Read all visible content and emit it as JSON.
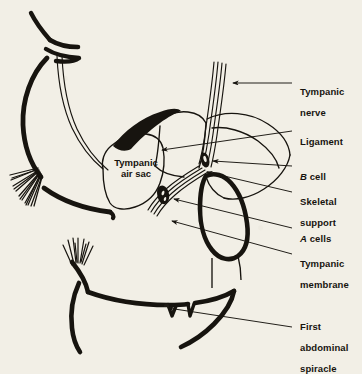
{
  "figure": {
    "background_color": "#f2efe6",
    "ink_color": "#17140f"
  },
  "inner_label": {
    "text": "Tympanic\nair sac",
    "name": "tympanic-air-sac"
  },
  "labels": [
    {
      "id": "tympanic-nerve",
      "line1": "Tympanic",
      "line2": "nerve",
      "italic_prefix": ""
    },
    {
      "id": "ligament",
      "line1": "Ligament",
      "line2": "",
      "italic_prefix": ""
    },
    {
      "id": "b-cell",
      "line1": "cell",
      "line2": "",
      "italic_prefix": "B"
    },
    {
      "id": "skeletal-support",
      "line1": "Skeletal",
      "line2": "support",
      "italic_prefix": ""
    },
    {
      "id": "a-cells",
      "line1": "cells",
      "line2": "",
      "italic_prefix": "A"
    },
    {
      "id": "tympanic-membrane",
      "line1": "Tympanic",
      "line2": "membrane",
      "italic_prefix": ""
    },
    {
      "id": "first-abdominal-spiracle",
      "line1": "First",
      "line2": "abdominal",
      "line3": "spiracle",
      "italic_prefix": ""
    }
  ],
  "structures": [
    {
      "id": "tympanic-nerve-bundle",
      "label": "tympanic nerve"
    },
    {
      "id": "ligament-wedge",
      "label": "ligament"
    },
    {
      "id": "b-cell-body",
      "label": "B cell"
    },
    {
      "id": "a-cells-cluster",
      "label": "A cells"
    },
    {
      "id": "tympanic-membrane-ring",
      "label": "tympanic membrane"
    },
    {
      "id": "skeletal-support-lobe",
      "label": "skeletal support"
    },
    {
      "id": "air-sac-chamber",
      "label": "tympanic air sac"
    },
    {
      "id": "spiracle-notch",
      "label": "first abdominal spiracle"
    },
    {
      "id": "upper-body-segment",
      "label": "upper body wall"
    },
    {
      "id": "lower-body-segment",
      "label": "lower body wall"
    },
    {
      "id": "hair-brush-upper",
      "label": "hair brush upper"
    },
    {
      "id": "hair-brush-lower",
      "label": "hair tuft lower"
    }
  ]
}
